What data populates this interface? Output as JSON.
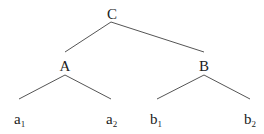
{
  "diagram": {
    "type": "tree",
    "root": {
      "label": "C",
      "children": [
        {
          "label": "A",
          "children": [
            {
              "base": "a",
              "sub": "1"
            },
            {
              "base": "a",
              "sub": "2"
            }
          ]
        },
        {
          "label": "B",
          "children": [
            {
              "base": "b",
              "sub": "1"
            },
            {
              "base": "b",
              "sub": "2"
            }
          ]
        }
      ]
    },
    "nodes": {
      "C": "C",
      "A": "A",
      "B": "B",
      "a1": {
        "base": "a",
        "sub": "1"
      },
      "a2": {
        "base": "a",
        "sub": "2"
      },
      "b1": {
        "base": "b",
        "sub": "1"
      },
      "b2": {
        "base": "b",
        "sub": "2"
      }
    },
    "colors": {
      "text": "#222222",
      "edge": "#555555",
      "background": "#ffffff"
    }
  }
}
